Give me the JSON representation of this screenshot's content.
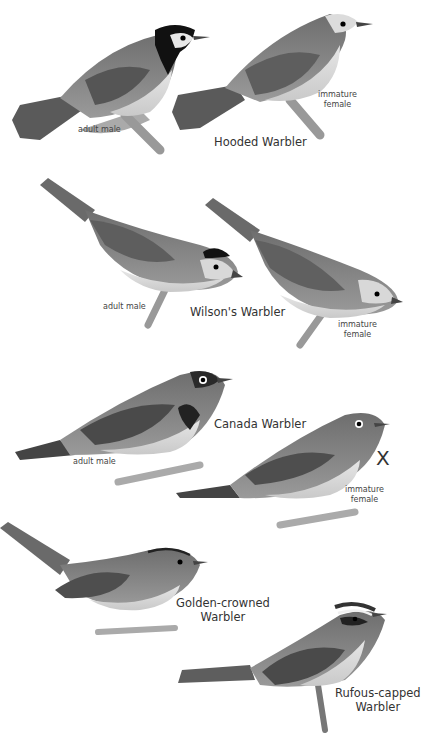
{
  "plate": {
    "species": [
      {
        "name": "Hooded Warbler",
        "figures": [
          {
            "label": "adult male"
          },
          {
            "label_line1": "immature",
            "label_line2": "female"
          }
        ]
      },
      {
        "name": "Wilson's Warbler",
        "figures": [
          {
            "label": "adult male"
          },
          {
            "label_line1": "immature",
            "label_line2": "female"
          }
        ]
      },
      {
        "name": "Canada Warbler",
        "figures": [
          {
            "label": "adult male"
          },
          {
            "label_line1": "immature",
            "label_line2": "female"
          }
        ],
        "mark": "X"
      },
      {
        "name_line1": "Golden-crowned",
        "name_line2": "Warbler"
      },
      {
        "name_line1": "Rufous-capped",
        "name_line2": "Warbler"
      }
    ]
  }
}
